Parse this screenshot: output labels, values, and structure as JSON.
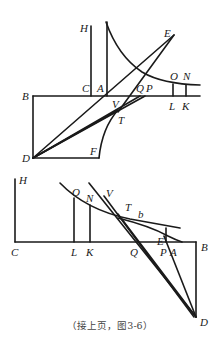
{
  "figure": {
    "caption": "（接上页，图3-6）",
    "top_diagram": {
      "labels": {
        "H": "H",
        "E": "E",
        "C": "C",
        "A": "A",
        "Q": "Q",
        "P": "P",
        "O": "O",
        "N": "N",
        "B": "B",
        "V": "V",
        "L": "L",
        "K": "K",
        "T": "T",
        "D": "D",
        "F": "F"
      }
    },
    "bottom_diagram": {
      "labels": {
        "H": "H",
        "O": "O",
        "N": "N",
        "V": "V",
        "T": "T",
        "b": "b",
        "C": "C",
        "L": "L",
        "K": "K",
        "Q": "Q",
        "E": "E",
        "P": "P",
        "A": "A",
        "B": "B",
        "D": "D"
      }
    },
    "stroke_color": "#1a1a1a",
    "background": "#ffffff"
  }
}
